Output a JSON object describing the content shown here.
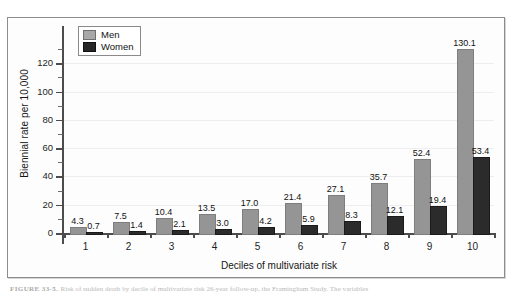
{
  "figure": {
    "caption_prefix": "FIGURE 33-5.",
    "caption_text": "Risk of sudden death by decile of multivariate risk 26-year follow-up, the Framingham Study. The variables"
  },
  "legend": {
    "position": "top-left-inside",
    "items": [
      {
        "label": "Men",
        "color": "#959595"
      },
      {
        "label": "Women",
        "color": "#2b2b2b"
      }
    ]
  },
  "axes": {
    "y_label": "Biennial rate per 10,000",
    "x_label": "Deciles of multivariate risk",
    "y_ticks": [
      "0",
      "20",
      "40",
      "60",
      "80",
      "100",
      "120"
    ],
    "y_minor_ticks": [
      10,
      30,
      50,
      70,
      90,
      110,
      130
    ],
    "x_ticks": [
      "1",
      "2",
      "3",
      "4",
      "5",
      "6",
      "7",
      "8",
      "9",
      "10"
    ]
  },
  "chart_data": {
    "type": "bar",
    "title": "",
    "subtitle": "",
    "xlabel": "Deciles of multivariate risk",
    "ylabel": "Biennial rate per 10,000",
    "categories": [
      "1",
      "2",
      "3",
      "4",
      "5",
      "6",
      "7",
      "8",
      "9",
      "10"
    ],
    "series": [
      {
        "name": "Men",
        "color": "#959595",
        "values": [
          4.3,
          7.5,
          10.4,
          13.5,
          17.0,
          21.4,
          27.1,
          35.7,
          52.4,
          130.1
        ],
        "labels": [
          "4.3",
          "7.5",
          "10.4",
          "13.5",
          "17.0",
          "21.4",
          "27.1",
          "35.7",
          "52.4",
          "130.1"
        ]
      },
      {
        "name": "Women",
        "color": "#2b2b2b",
        "values": [
          0.7,
          1.4,
          2.1,
          3.0,
          4.2,
          5.9,
          8.3,
          12.1,
          19.4,
          53.4
        ],
        "labels": [
          "0.7",
          "1.4",
          "2.1",
          "3.0",
          "4.2",
          "5.9",
          "8.3",
          "12.1",
          "19.4",
          "53.4"
        ]
      }
    ],
    "ylim": [
      0,
      140
    ],
    "ytick_step": 20,
    "grid": "horizontal-faint",
    "legend_position": "upper left",
    "data_labels": true
  }
}
